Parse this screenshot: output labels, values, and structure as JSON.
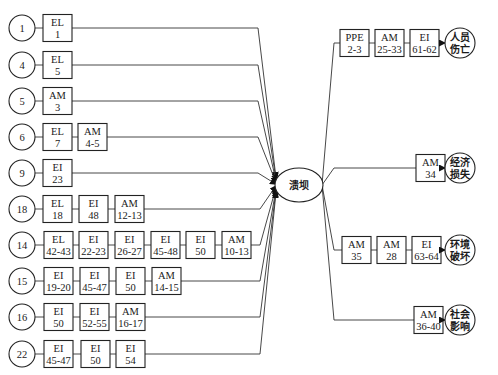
{
  "center": {
    "label": "溃坝"
  },
  "left_chains": [
    {
      "id": "1",
      "boxes": [
        {
          "code": "EL",
          "range": "1"
        }
      ]
    },
    {
      "id": "4",
      "boxes": [
        {
          "code": "EL",
          "range": "5"
        }
      ]
    },
    {
      "id": "5",
      "boxes": [
        {
          "code": "AM",
          "range": "3"
        }
      ]
    },
    {
      "id": "6",
      "boxes": [
        {
          "code": "EL",
          "range": "7"
        },
        {
          "code": "AM",
          "range": "4-5"
        }
      ]
    },
    {
      "id": "9",
      "boxes": [
        {
          "code": "EI",
          "range": "23"
        }
      ]
    },
    {
      "id": "18",
      "boxes": [
        {
          "code": "EL",
          "range": "18"
        },
        {
          "code": "EI",
          "range": "48"
        },
        {
          "code": "AM",
          "range": "12-13"
        }
      ]
    },
    {
      "id": "14",
      "boxes": [
        {
          "code": "EL",
          "range": "42-43"
        },
        {
          "code": "EI",
          "range": "22-23"
        },
        {
          "code": "EI",
          "range": "26-27"
        },
        {
          "code": "EI",
          "range": "45-48"
        },
        {
          "code": "EI",
          "range": "50"
        },
        {
          "code": "AM",
          "range": "10-13"
        }
      ]
    },
    {
      "id": "15",
      "boxes": [
        {
          "code": "EI",
          "range": "19-20"
        },
        {
          "code": "EI",
          "range": "45-47"
        },
        {
          "code": "EI",
          "range": "50"
        },
        {
          "code": "AM",
          "range": "14-15"
        }
      ]
    },
    {
      "id": "16",
      "boxes": [
        {
          "code": "EI",
          "range": "50"
        },
        {
          "code": "EI",
          "range": "52-55"
        },
        {
          "code": "AM",
          "range": "16-17"
        }
      ]
    },
    {
      "id": "22",
      "boxes": [
        {
          "code": "EI",
          "range": "45-47"
        },
        {
          "code": "EI",
          "range": "50"
        },
        {
          "code": "EI",
          "range": "54"
        }
      ]
    }
  ],
  "right_chains": [
    {
      "outcome": [
        "人员",
        "伤亡"
      ],
      "boxes": [
        {
          "code": "PPE",
          "range": "2-3"
        },
        {
          "code": "AM",
          "range": "25-33"
        },
        {
          "code": "EI",
          "range": "61-62"
        }
      ]
    },
    {
      "outcome": [
        "经济",
        "损失"
      ],
      "boxes": [
        {
          "code": "AM",
          "range": "34"
        }
      ]
    },
    {
      "outcome": [
        "环境",
        "破坏"
      ],
      "boxes": [
        {
          "code": "AM",
          "range": "35"
        },
        {
          "code": "AM",
          "range": "28"
        },
        {
          "code": "EI",
          "range": "63-64"
        }
      ]
    },
    {
      "outcome": [
        "社会",
        "影响"
      ],
      "boxes": [
        {
          "code": "AM",
          "range": "36-40"
        }
      ]
    }
  ]
}
